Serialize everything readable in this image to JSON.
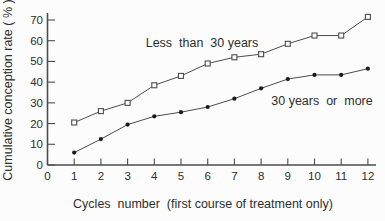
{
  "chart_data": {
    "type": "line",
    "title": "",
    "xlabel": "Cycles  number  (first course of treatment only)",
    "ylabel": "Cumulative conception rate ( % )",
    "x": [
      1,
      2,
      3,
      4,
      5,
      6,
      7,
      8,
      9,
      10,
      11,
      12
    ],
    "series": [
      {
        "name": "Less than 30 years",
        "marker": "open-square",
        "values": [
          20.5,
          26,
          30,
          38.5,
          43,
          49,
          52,
          53.5,
          58.5,
          62.5,
          62.5,
          71.5
        ]
      },
      {
        "name": "30 years or more",
        "marker": "filled-circle",
        "values": [
          6,
          12.5,
          19.5,
          23.5,
          25.5,
          28,
          32,
          37,
          41.5,
          43.5,
          43.5,
          46.5
        ]
      }
    ],
    "annotations": [
      {
        "text": "Less  than  30 years",
        "series": "Less than 30 years"
      },
      {
        "text": "30 years  or  more",
        "series": "30 years or more"
      }
    ],
    "x_ticks": [
      0,
      1,
      2,
      3,
      4,
      5,
      6,
      7,
      8,
      9,
      10,
      11,
      12
    ],
    "y_ticks": [
      0,
      10,
      20,
      30,
      40,
      50,
      60,
      70
    ],
    "xlim": [
      0,
      12.3
    ],
    "ylim": [
      0,
      70
    ],
    "grid": false,
    "legend_position": "inline-annotations",
    "line_color": "#4d4d4d",
    "text_color": "#2e2e2e",
    "background_color": "#fcfcfc"
  }
}
